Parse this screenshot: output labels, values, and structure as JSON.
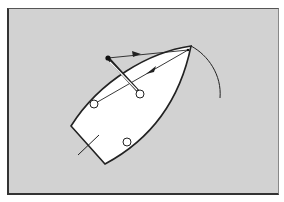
{
  "diagram": {
    "type": "sailing-dinghy-top-view",
    "colors": {
      "background": "#d2d2d2",
      "hull_fill": "#ffffff",
      "stroke": "#222222"
    },
    "hull": {
      "bow": [
        191,
        46
      ],
      "transom_port": [
        71,
        126
      ],
      "transom_starboard": [
        105,
        164
      ]
    },
    "rudder": {
      "from": [
        78,
        155
      ],
      "to": [
        99,
        135
      ]
    },
    "fittings": [
      {
        "name": "port-fitting",
        "cx": 94,
        "cy": 104,
        "r": 4
      },
      {
        "name": "centre-fitting",
        "cx": 140,
        "cy": 94,
        "r": 4
      },
      {
        "name": "starboard-fitting",
        "cx": 127,
        "cy": 142,
        "r": 4
      }
    ],
    "jib_sheet_point": [
      108,
      58
    ],
    "forestay_point": [
      188,
      50
    ],
    "sail_arc": {
      "from": [
        191,
        46
      ],
      "to": [
        220,
        98
      ]
    },
    "arrows": [
      {
        "name": "sheet-arrow",
        "from": [
          108,
          58
        ],
        "to": [
          188,
          50
        ],
        "marker_at": [
          136,
          55
        ]
      },
      {
        "name": "pull-arrow",
        "from": [
          188,
          50
        ],
        "to": [
          94,
          104
        ],
        "marker_at": [
          150,
          72
        ]
      }
    ]
  }
}
